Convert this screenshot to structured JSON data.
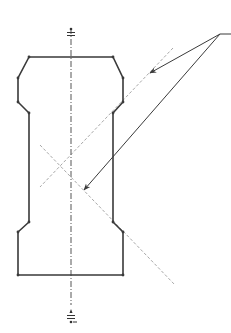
{
  "diagram": {
    "type": "technical-drawing",
    "colors": {
      "outline": "#3a3a3a",
      "centerline": "#555555",
      "dashed": "#a8a8a8",
      "leader": "#3a3a3a",
      "background": "#ffffff"
    },
    "centerline": {
      "x": 71,
      "y1": 28,
      "y2": 305
    },
    "outline_points": [
      [
        29,
        57
      ],
      [
        113,
        57
      ],
      [
        123,
        78
      ],
      [
        123,
        102
      ],
      [
        113,
        113
      ],
      [
        113,
        222
      ],
      [
        123,
        232
      ],
      [
        123,
        275
      ],
      [
        18,
        275
      ],
      [
        18,
        232
      ],
      [
        29,
        222
      ],
      [
        29,
        113
      ],
      [
        18,
        102
      ],
      [
        18,
        78
      ],
      [
        29,
        57
      ]
    ],
    "dashed_lines": [
      {
        "x1": 173,
        "y1": 48,
        "x2": 40,
        "y2": 187
      },
      {
        "x1": 40,
        "y1": 145,
        "x2": 175,
        "y2": 285
      }
    ],
    "leader": {
      "origin": [
        220,
        34
      ],
      "tail_end": [
        231,
        34
      ],
      "arrows": [
        [
          150,
          73
        ],
        [
          84,
          190
        ]
      ]
    },
    "axis_symbols": {
      "top": {
        "x": 71,
        "y": 34
      },
      "bottom": {
        "x": 71,
        "y": 317
      }
    }
  }
}
